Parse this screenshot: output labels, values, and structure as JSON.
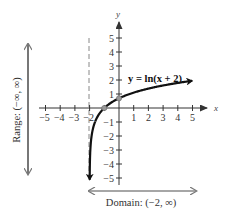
{
  "chart_data": {
    "type": "line",
    "title": "",
    "equation_label": "y = ln(x + 2)",
    "xlabel": "x",
    "ylabel": "y",
    "xlim": [
      -5,
      5
    ],
    "ylim": [
      -5,
      5
    ],
    "x_ticks": [
      -5,
      -4,
      -3,
      -2,
      -1,
      1,
      2,
      3,
      4,
      5
    ],
    "y_ticks": [
      5,
      4,
      3,
      2,
      1,
      -1,
      -2,
      -3,
      -4,
      -5
    ],
    "x_tick_labels": [
      "−5",
      "−4",
      "−3",
      "−2",
      "1",
      "2",
      "3",
      "4",
      "5"
    ],
    "y_tick_labels": [
      "5",
      "4",
      "3",
      "2",
      "1",
      "−1",
      "−2",
      "−3",
      "−4",
      "−5"
    ],
    "grid": false,
    "asymptote": {
      "type": "vertical",
      "x": -2,
      "style": "dashed"
    },
    "series": [
      {
        "name": "y = ln(x + 2)",
        "x": [
          -1.9933,
          -1.98,
          -1.95,
          -1.9,
          -1.8,
          -1.6,
          -1.4,
          -1.0,
          -0.5,
          0,
          1,
          2,
          3,
          4,
          5
        ],
        "values": [
          -5.0,
          -3.91,
          -3.0,
          -2.3,
          -1.61,
          -0.92,
          -0.51,
          0.0,
          0.41,
          0.69,
          1.1,
          1.39,
          1.61,
          1.79,
          1.95
        ]
      }
    ],
    "highlighted_points": [
      {
        "x": -1,
        "y": 0
      },
      {
        "x": 0,
        "y": 0.69
      }
    ],
    "annotations": {
      "range": "Range: (−∞, ∞)",
      "domain": "Domain: (−2, ∞)"
    }
  }
}
